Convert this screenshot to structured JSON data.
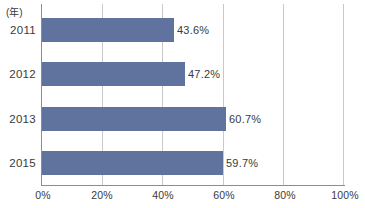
{
  "chart_data": {
    "type": "bar",
    "orientation": "horizontal",
    "title": "",
    "xlabel": "",
    "ylabel": "(年)",
    "categories": [
      "2011",
      "2012",
      "2013",
      "2015"
    ],
    "values": [
      43.6,
      47.2,
      60.7,
      59.7
    ],
    "data_labels": [
      "43.6%",
      "47.2%",
      "60.7%",
      "59.7%"
    ],
    "xlim": [
      0,
      100
    ],
    "xticks": [
      0,
      20,
      40,
      60,
      80,
      100
    ],
    "xtick_labels": [
      "0%",
      "20%",
      "40%",
      "60%",
      "80%",
      "100%"
    ],
    "grid": true,
    "grid_axis": "x",
    "legend": null,
    "series": [
      {
        "name": "",
        "color": "#5f739e",
        "values": [
          43.6,
          47.2,
          60.7,
          59.7
        ]
      }
    ]
  },
  "axis": {
    "unit_label": "(年)",
    "line_color": "#8d8d8d",
    "grid_color": "#c9c9c9"
  },
  "colors": {
    "bar": "#5f739e",
    "text": "#3a3a3a",
    "background": "#ffffff"
  }
}
